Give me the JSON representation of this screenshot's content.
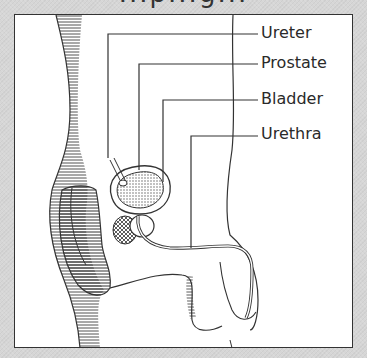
{
  "title_fragment": "...p...g...",
  "diagram": {
    "labels": [
      {
        "id": "ureter",
        "text": "Ureter"
      },
      {
        "id": "prostate",
        "text": "Prostate"
      },
      {
        "id": "bladder",
        "text": "Bladder"
      },
      {
        "id": "urethra",
        "text": "Urethra"
      }
    ]
  },
  "colors": {
    "background": "#d6d6d6",
    "frame": "#ffffff",
    "line": "#333333",
    "text": "#2a2a2a"
  }
}
